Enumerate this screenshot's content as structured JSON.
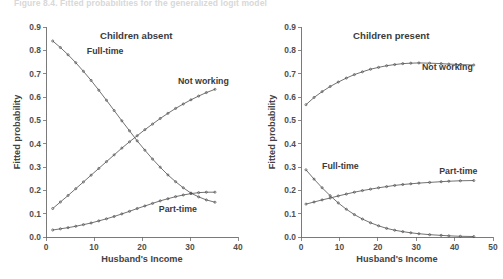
{
  "figure": {
    "caption": "Figure 8.4.  Fitted probabilities for the generalized logit model"
  },
  "chart_data": [
    {
      "id": "children-absent",
      "type": "line",
      "title": "Children absent",
      "xlabel": "Husband's Income",
      "ylabel": "Fitted probability",
      "xlim": [
        0,
        40
      ],
      "ylim": [
        0.0,
        0.9
      ],
      "xticks": [
        "0",
        "10",
        "20",
        "30",
        "40"
      ],
      "xtick_values": [
        0,
        10,
        20,
        30,
        40
      ],
      "yticks": [
        "0.0",
        "0.1",
        "0.2",
        "0.3",
        "0.4",
        "0.5",
        "0.6",
        "0.7",
        "0.8",
        "0.9"
      ],
      "ytick_values": [
        0.0,
        0.1,
        0.2,
        0.3,
        0.4,
        0.5,
        0.6,
        0.7,
        0.8,
        0.9
      ],
      "grid": false,
      "legend_position": "inline-annotations",
      "markers": true,
      "series": [
        {
          "name": "Full-time",
          "label_x": 8.5,
          "label_y": 0.785,
          "x": [
            1.4,
            3.0,
            4.6,
            6.2,
            7.8,
            9.4,
            11.0,
            12.6,
            14.2,
            15.8,
            17.4,
            19.0,
            20.6,
            22.2,
            23.8,
            25.4,
            27.0,
            28.6,
            30.2,
            31.8,
            33.4,
            35.2
          ],
          "values": [
            0.84,
            0.812,
            0.781,
            0.747,
            0.71,
            0.671,
            0.629,
            0.586,
            0.542,
            0.498,
            0.455,
            0.412,
            0.372,
            0.334,
            0.299,
            0.266,
            0.237,
            0.211,
            0.188,
            0.172,
            0.159,
            0.149
          ]
        },
        {
          "name": "Not working",
          "label_x": 27.5,
          "label_y": 0.655,
          "x": [
            1.4,
            3.0,
            4.6,
            6.2,
            7.8,
            9.4,
            11.0,
            12.6,
            14.2,
            15.8,
            17.4,
            19.0,
            20.6,
            22.2,
            23.8,
            25.4,
            27.0,
            28.6,
            30.2,
            31.8,
            33.4,
            35.2
          ],
          "values": [
            0.122,
            0.15,
            0.178,
            0.207,
            0.236,
            0.265,
            0.294,
            0.323,
            0.352,
            0.381,
            0.408,
            0.434,
            0.46,
            0.484,
            0.508,
            0.53,
            0.551,
            0.57,
            0.588,
            0.604,
            0.619,
            0.633
          ]
        },
        {
          "name": "Part-time",
          "label_x": 23.5,
          "label_y": 0.108,
          "x": [
            1.4,
            3.0,
            4.6,
            6.2,
            7.8,
            9.4,
            11.0,
            12.6,
            14.2,
            15.8,
            17.4,
            19.0,
            20.6,
            22.2,
            23.8,
            25.4,
            27.0,
            28.6,
            30.2,
            31.8,
            33.4,
            35.2
          ],
          "values": [
            0.03,
            0.035,
            0.04,
            0.046,
            0.053,
            0.06,
            0.069,
            0.078,
            0.088,
            0.099,
            0.11,
            0.122,
            0.133,
            0.144,
            0.155,
            0.164,
            0.173,
            0.18,
            0.186,
            0.19,
            0.192,
            0.192
          ]
        }
      ]
    },
    {
      "id": "children-present",
      "type": "line",
      "title": "Children present",
      "xlabel": "Husband's Income",
      "ylabel": "Fitted probability",
      "xlim": [
        0,
        50
      ],
      "ylim": [
        0.0,
        0.9
      ],
      "xticks": [
        "0",
        "10",
        "20",
        "30",
        "40",
        "50"
      ],
      "xtick_values": [
        0,
        10,
        20,
        30,
        40,
        50
      ],
      "yticks": [
        "0.0",
        "0.1",
        "0.2",
        "0.3",
        "0.4",
        "0.5",
        "0.6",
        "0.7",
        "0.8",
        "0.9"
      ],
      "ytick_values": [
        0.0,
        0.1,
        0.2,
        0.3,
        0.4,
        0.5,
        0.6,
        0.7,
        0.8,
        0.9
      ],
      "grid": false,
      "legend_position": "inline-annotations",
      "markers": true,
      "series": [
        {
          "name": "Not working",
          "label_x": 31.5,
          "label_y": 0.715,
          "x": [
            1.3,
            3.4,
            5.5,
            7.6,
            9.7,
            11.8,
            13.9,
            16.0,
            18.1,
            20.2,
            22.3,
            24.4,
            26.5,
            28.6,
            30.7,
            33.5,
            36.5,
            38.5,
            41.5,
            45.0
          ],
          "values": [
            0.567,
            0.598,
            0.623,
            0.645,
            0.664,
            0.681,
            0.696,
            0.708,
            0.719,
            0.727,
            0.734,
            0.739,
            0.743,
            0.745,
            0.746,
            0.745,
            0.743,
            0.741,
            0.739,
            0.737
          ]
        },
        {
          "name": "Full-time",
          "label_x": 5.5,
          "label_y": 0.293,
          "x": [
            1.3,
            3.4,
            5.5,
            7.6,
            9.7,
            11.8,
            13.9,
            16.0,
            18.1,
            20.2,
            22.3,
            24.4,
            26.5,
            28.6,
            30.7,
            33.5,
            36.5,
            38.5,
            41.5,
            45.0
          ],
          "values": [
            0.288,
            0.248,
            0.211,
            0.177,
            0.146,
            0.119,
            0.096,
            0.077,
            0.061,
            0.048,
            0.037,
            0.029,
            0.023,
            0.018,
            0.014,
            0.01,
            0.007,
            0.005,
            0.003,
            0.002
          ]
        },
        {
          "name": "Part-time",
          "label_x": 36.0,
          "label_y": 0.268,
          "x": [
            1.3,
            3.4,
            5.5,
            7.6,
            9.7,
            11.8,
            13.9,
            16.0,
            18.1,
            20.2,
            22.3,
            24.4,
            26.5,
            28.6,
            30.7,
            33.5,
            36.5,
            38.5,
            41.5,
            45.0
          ],
          "values": [
            0.141,
            0.15,
            0.159,
            0.167,
            0.176,
            0.184,
            0.192,
            0.199,
            0.205,
            0.211,
            0.216,
            0.221,
            0.225,
            0.228,
            0.231,
            0.234,
            0.237,
            0.239,
            0.241,
            0.242
          ]
        }
      ]
    }
  ]
}
